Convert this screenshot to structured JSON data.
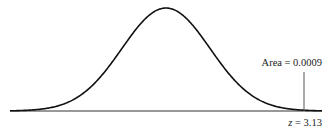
{
  "chart_data": {
    "type": "line",
    "title": "",
    "distribution": "standard normal",
    "mean": 0,
    "sd": 1,
    "xlabel": "",
    "ylabel": "",
    "grid": false,
    "legend": null,
    "markers": [
      {
        "z": 3.13,
        "label": "z = 3.13",
        "tail": "right",
        "area": 0.0009,
        "area_label": "Area = 0.0009"
      }
    ]
  },
  "labels": {
    "area": "Area = 0.0009",
    "z": "z = 3.13"
  },
  "colors": {
    "curve": "#111111",
    "axis": "#333333",
    "marker": "#555555"
  }
}
